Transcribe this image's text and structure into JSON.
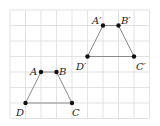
{
  "diagram": {
    "type": "geometry-translation",
    "grid": {
      "origin_px": [
        10,
        10
      ],
      "cell_px": 15.5,
      "cols": 9,
      "rows": 7,
      "line_color": "#dcdcdc"
    },
    "shapes": [
      {
        "name": "ABCD",
        "points": [
          {
            "label": "A",
            "grid": [
              2,
              4
            ]
          },
          {
            "label": "B",
            "grid": [
              3,
              4
            ]
          },
          {
            "label": "C",
            "grid": [
              4,
              6
            ]
          },
          {
            "label": "D",
            "grid": [
              1,
              6
            ]
          }
        ]
      },
      {
        "name": "A'B'C'D'",
        "points": [
          {
            "label": "A′",
            "grid": [
              6,
              1
            ]
          },
          {
            "label": "B′",
            "grid": [
              7,
              1
            ]
          },
          {
            "label": "C′",
            "grid": [
              8,
              3
            ]
          },
          {
            "label": "D′",
            "grid": [
              5,
              3
            ]
          }
        ]
      }
    ],
    "edge_color": "#8a8a8a",
    "point_color": "#111111"
  },
  "labels": {
    "A": "A",
    "B": "B",
    "C": "C",
    "D": "D",
    "A2": "A′",
    "B2": "B′",
    "C2": "C′",
    "D2": "D′"
  }
}
